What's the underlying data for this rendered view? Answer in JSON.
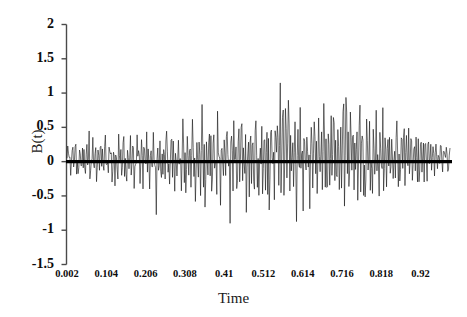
{
  "chart_data": {
    "type": "line",
    "title": "",
    "xlabel": "Time",
    "ylabel": "B(t)",
    "xlim": [
      0.002,
      0.9965
    ],
    "ylim": [
      -1.5,
      2
    ],
    "grid": false,
    "legend": null,
    "yticks": [
      "2",
      "1.5",
      "1",
      "0.5",
      "0",
      "-0.5",
      "-1",
      "-1.5"
    ],
    "ytick_values": [
      2,
      1.5,
      1,
      0.5,
      0,
      -0.5,
      -1,
      -1.5
    ],
    "xticks": [
      "0.002",
      "0.104",
      "0.206",
      "0.308",
      "0.41",
      "0.512",
      "0.614",
      "0.716",
      "0.818",
      "0.92"
    ],
    "xtick_values": [
      0.002,
      0.104,
      0.206,
      0.308,
      0.41,
      0.512,
      0.614,
      0.716,
      0.818,
      0.92
    ],
    "series": [
      {
        "name": "B(t)",
        "color": "#111111",
        "linewidth": 0.6,
        "description": "Noisy zero-mean fluctuating signal with growing amplitude toward the middle",
        "values": [
          0.02,
          0.23,
          -0.07,
          0.16,
          -0.21,
          0.09,
          0.29,
          -0.12,
          0.05,
          0.33,
          -0.18,
          0.12,
          -0.29,
          0.21,
          0.07,
          -0.14,
          0.27,
          -0.05,
          0.18,
          -0.31,
          0.11,
          0.25,
          -0.22,
          0.58,
          -0.35,
          0.14,
          -0.09,
          0.31,
          -0.27,
          0.06,
          0.19,
          -0.41,
          0.23,
          0.08,
          -0.16,
          0.35,
          -0.11,
          0.27,
          -0.33,
          0.15,
          0.42,
          -0.19,
          0.09,
          -0.25,
          0.38,
          -0.07,
          0.21,
          -0.44,
          0.13,
          0.29,
          -0.36,
          0.18,
          0.05,
          -0.23,
          0.47,
          -0.15,
          0.32,
          -0.28,
          0.11,
          0.39,
          -0.21,
          0.24,
          -0.48,
          0.17,
          0.08,
          -0.13,
          0.41,
          -0.26,
          0.19,
          0.33,
          -0.37,
          0.12,
          -0.22,
          0.45,
          -0.09,
          0.28,
          -0.31,
          0.16,
          0.38,
          -0.44,
          0.21,
          0.07,
          -0.27,
          0.36,
          -0.18,
          0.42,
          -0.53,
          0.13,
          0.25,
          -0.29,
          0.47,
          -0.11,
          0.19,
          -0.68,
          0.31,
          0.08,
          -0.22,
          0.39,
          -0.47,
          0.24,
          -0.15,
          0.43,
          -0.33,
          0.18,
          0.55,
          -0.26,
          0.11,
          -0.38,
          0.29,
          0.47,
          -0.19,
          0.35,
          -0.58,
          0.22,
          0.09,
          -0.31,
          0.51,
          -0.24,
          0.37,
          -0.42,
          0.16,
          0.62,
          -0.28,
          0.21,
          -0.55,
          0.33,
          0.08,
          -0.19,
          0.44,
          -0.36,
          0.27,
          0.82,
          -0.31,
          0.15,
          -0.61,
          0.39,
          0.23,
          -0.27,
          0.58,
          -0.43,
          0.18,
          1.01,
          -0.52,
          0.29,
          -1.05,
          0.36,
          0.12,
          -0.25,
          0.66,
          -0.38,
          0.44,
          -0.71,
          0.21,
          0.57,
          -0.33,
          0.28,
          -0.49,
          0.81,
          -0.18,
          0.35,
          -0.62,
          0.42,
          0.15,
          -0.27,
          0.69,
          -0.55,
          0.31,
          0.48,
          -0.36,
          0.23,
          -0.82,
          0.57,
          0.19,
          -0.41,
          0.75,
          -0.29,
          0.38,
          -0.67,
          0.26,
          0.51,
          -0.34,
          0.18,
          0.62,
          -0.48,
          0.29,
          -0.25,
          0.44,
          -0.78,
          0.33,
          0.21,
          -0.57,
          0.68,
          -0.31,
          0.42,
          0.15,
          -0.63,
          0.28,
          0.77,
          -0.39,
          0.24,
          -0.52,
          0.58,
          -0.28,
          0.35,
          -0.91,
          0.47,
          0.19,
          -0.36,
          0.83,
          -0.44,
          0.27,
          -1.0,
          0.39,
          0.58,
          -0.31,
          0.22,
          -0.66,
          0.71,
          -0.25,
          0.44,
          0.18,
          -0.48,
          1.45,
          -0.37,
          0.29,
          1.1,
          -0.59,
          0.35,
          0.86,
          -0.44,
          0.21,
          1.48,
          -0.68,
          0.32,
          -0.31,
          0.77,
          -0.52,
          0.25,
          0.63,
          -1.18,
          0.41,
          0.18,
          -0.29,
          0.92,
          -0.47,
          0.34,
          -0.73,
          0.56,
          0.22,
          -0.38,
          0.69,
          -0.26,
          0.47,
          -0.81,
          0.31,
          0.58,
          -0.44,
          0.19,
          0.74,
          -0.35,
          0.28,
          -0.62,
          0.51,
          0.23,
          -0.47,
          0.88,
          -0.29,
          0.39,
          0.95,
          -0.55,
          0.33,
          -0.71,
          0.66,
          0.21,
          -0.41,
          0.83,
          -0.36,
          0.48,
          1.02,
          -0.28,
          0.25,
          -0.78,
          0.57,
          0.34,
          -0.49,
          0.91,
          -0.33,
          0.44,
          1.21,
          -0.61,
          0.27,
          1.48,
          -0.42,
          0.36,
          -0.68,
          0.72,
          0.23,
          -0.37,
          0.88,
          -0.51,
          0.31,
          -0.24,
          0.64,
          -0.73,
          0.42,
          1.01,
          -0.33,
          0.28,
          0.77,
          -0.47,
          0.21,
          -0.85,
          0.55,
          0.38,
          -0.29,
          0.69,
          -0.41,
          0.33,
          -0.62,
          0.47,
          0.24,
          -0.36,
          0.86,
          -0.28,
          0.41,
          -0.73,
          0.57,
          0.19,
          -0.48,
          0.71,
          -0.81,
          0.35,
          0.26,
          -0.39,
          0.62,
          -0.24,
          0.44,
          -0.57,
          0.31,
          0.18,
          -0.42,
          0.53,
          -0.29,
          0.38,
          0.66,
          -0.35,
          0.22,
          -0.51,
          0.47,
          0.28,
          -0.33,
          0.78,
          -0.44,
          0.19,
          0.35,
          -0.27,
          0.58,
          -0.39,
          0.24,
          0.41,
          -0.48,
          0.31,
          0.16,
          -0.22,
          0.52,
          -0.36,
          0.27,
          -0.44,
          0.38,
          0.21,
          -0.31,
          0.45,
          -0.25,
          0.33,
          0.18,
          -0.39,
          0.29,
          0.24,
          -0.16,
          0.36,
          -0.28,
          0.21,
          0.14,
          -0.33,
          0.26,
          0.09,
          -0.19,
          0.31,
          -0.12,
          0.23,
          0.16,
          -0.26,
          0.11,
          0.19,
          -0.08,
          0.14,
          0.07,
          -0.15,
          0.09,
          0.12
        ]
      }
    ],
    "baseline": {
      "name": "zero-line",
      "value": 0,
      "color": "#000000",
      "linewidth": 3.2
    }
  }
}
